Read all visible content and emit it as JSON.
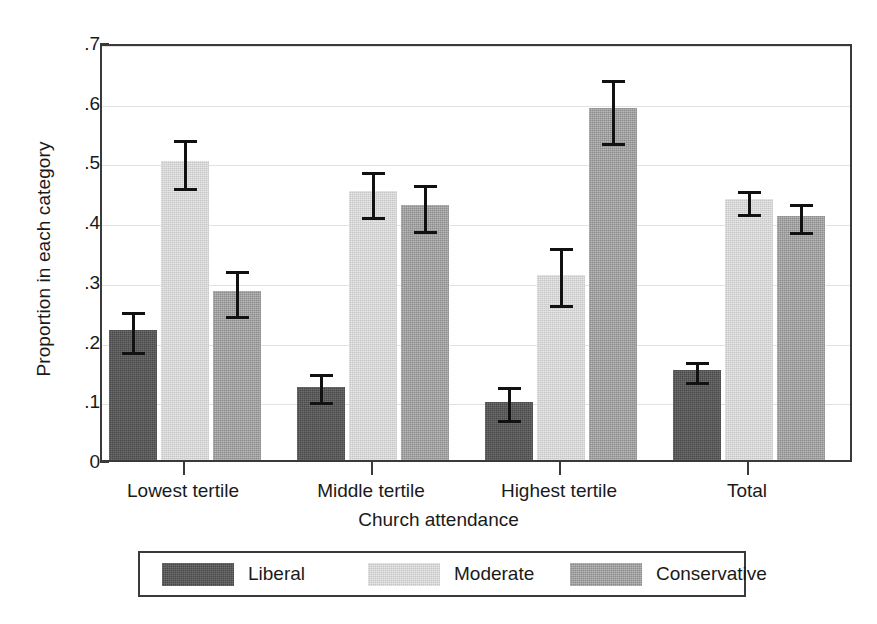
{
  "chart_data": {
    "type": "bar",
    "title": "",
    "xlabel": "Church attendance",
    "ylabel": "Proportion in each category",
    "categories": [
      "Lowest tertile",
      "Middle tertile",
      "Highest tertile",
      "Total"
    ],
    "ylim": [
      0,
      0.7
    ],
    "yticks": [
      0,
      0.1,
      0.2,
      0.3,
      0.4,
      0.5,
      0.6,
      0.7
    ],
    "ytick_labels": [
      "0",
      ".1",
      ".2",
      ".3",
      ".4",
      ".5",
      ".6",
      ".7"
    ],
    "grid": true,
    "legend_position": "below",
    "error_bars": "95% confidence interval",
    "series": [
      {
        "name": "Liberal",
        "color": "#4a4a4a",
        "values": [
          0.217,
          0.122,
          0.097,
          0.151
        ],
        "err_low": [
          0.182,
          0.098,
          0.069,
          0.133
        ],
        "err_high": [
          0.254,
          0.15,
          0.129,
          0.17
        ]
      },
      {
        "name": "Moderate",
        "color": "#c6c6c6",
        "values": [
          0.501,
          0.45,
          0.31,
          0.437
        ],
        "err_low": [
          0.457,
          0.409,
          0.262,
          0.413
        ],
        "err_high": [
          0.543,
          0.489,
          0.362,
          0.458
        ]
      },
      {
        "name": "Conservative",
        "color": "#8c8c8c",
        "values": [
          0.283,
          0.427,
          0.589,
          0.409
        ],
        "err_low": [
          0.243,
          0.385,
          0.533,
          0.383
        ],
        "err_high": [
          0.323,
          0.468,
          0.643,
          0.435
        ]
      }
    ]
  },
  "legend": {
    "entries": [
      {
        "label": "Liberal"
      },
      {
        "label": "Moderate"
      },
      {
        "label": "Conservative"
      }
    ]
  }
}
